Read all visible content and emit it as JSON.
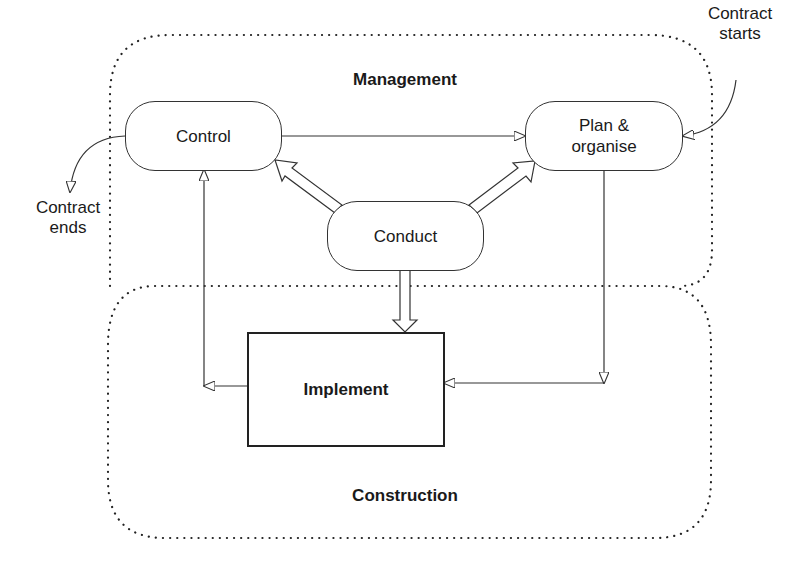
{
  "diagram": {
    "regions": {
      "management": {
        "label": "Management"
      },
      "construction": {
        "label": "Construction"
      }
    },
    "nodes": {
      "control": {
        "label": "Control"
      },
      "plan": {
        "label": "Plan & organise"
      },
      "conduct": {
        "label": "Conduct"
      },
      "implement": {
        "label": "Implement"
      }
    },
    "external": {
      "contract_starts": {
        "line1": "Contract",
        "line2": "starts"
      },
      "contract_ends": {
        "line1": "Contract",
        "line2": "ends"
      }
    },
    "edges": [
      {
        "from": "Control",
        "to": "Plan & organise",
        "style": "thin"
      },
      {
        "from": "Conduct",
        "to": "Control",
        "style": "hollow-thick"
      },
      {
        "from": "Conduct",
        "to": "Plan & organise",
        "style": "hollow-thick"
      },
      {
        "from": "Conduct",
        "to": "Implement",
        "style": "hollow-thick"
      },
      {
        "from": "Plan & organise",
        "to": "Implement",
        "style": "thin"
      },
      {
        "from": "Implement",
        "to": "Control",
        "style": "thin"
      },
      {
        "from": "Contract starts",
        "to": "Plan & organise",
        "style": "thin-curved"
      },
      {
        "from": "Control",
        "to": "Contract ends",
        "style": "thin-curved"
      }
    ],
    "colors": {
      "line": "#333333",
      "background": "#ffffff"
    }
  }
}
